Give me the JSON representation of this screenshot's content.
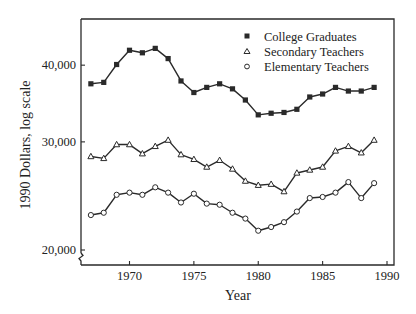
{
  "chart_data": {
    "type": "line",
    "title": "",
    "xlabel": "Year",
    "ylabel": "1990 Dollars, log scale",
    "yscale": "log",
    "xlim": [
      1966.3,
      1990.6
    ],
    "ylim": [
      19000,
      46000
    ],
    "grid": false,
    "legend_position": "upper right",
    "x_ticks": [
      1970,
      1975,
      1980,
      1985,
      1990
    ],
    "x_tick_labels": [
      "1970",
      "1975",
      "1980",
      "1985",
      "1990"
    ],
    "y_ticks": [
      20000,
      30000,
      40000
    ],
    "y_tick_labels": [
      "20,000",
      "30,000",
      "40,000"
    ],
    "y_axis_break": true,
    "x": [
      1967,
      1968,
      1969,
      1970,
      1971,
      1972,
      1973,
      1974,
      1975,
      1976,
      1977,
      1978,
      1979,
      1980,
      1981,
      1982,
      1983,
      1984,
      1985,
      1986,
      1987,
      1988,
      1989
    ],
    "series": [
      {
        "name": "College Graduates",
        "marker": "filled-square",
        "values": [
          37300,
          37500,
          40100,
          42300,
          41900,
          42600,
          41000,
          37700,
          36100,
          36800,
          37300,
          36600,
          35100,
          33200,
          33400,
          33500,
          33900,
          35500,
          35900,
          36800,
          36300,
          36300,
          36800
        ]
      },
      {
        "name": "Secondary Teachers",
        "marker": "open-triangle",
        "values": [
          28400,
          28200,
          29700,
          29700,
          28700,
          29500,
          30200,
          28600,
          28100,
          27300,
          28000,
          27100,
          25900,
          25500,
          25600,
          24900,
          26700,
          27000,
          27300,
          29000,
          29500,
          28800,
          30200
        ]
      },
      {
        "name": "Elementary Teachers",
        "marker": "open-circle",
        "values": [
          22800,
          23000,
          24600,
          24800,
          24600,
          25300,
          24800,
          23900,
          24700,
          23800,
          23700,
          23000,
          22500,
          21500,
          21800,
          22200,
          23100,
          24300,
          24400,
          24800,
          25800,
          24300,
          25700
        ]
      }
    ]
  },
  "layout": {
    "plot": {
      "left": 81,
      "right": 394,
      "top": 19,
      "bottom": 265
    },
    "x_map": {
      "x0": 1970,
      "px0": 129.5,
      "x1": 1990,
      "px1": 387
    },
    "y_map": {
      "v0": 20000,
      "py0": 250,
      "px_per_log10": 614
    },
    "colors": {
      "ink": "#2a2a2a",
      "background": "#ffffff"
    }
  }
}
